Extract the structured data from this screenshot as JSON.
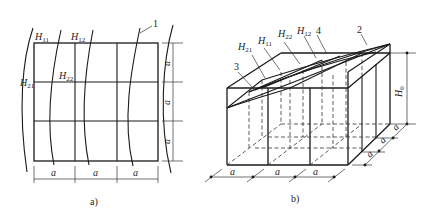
{
  "figure": {
    "panel_a": {
      "caption": "a)",
      "grid": {
        "rows": 3,
        "cols": 3
      },
      "labels": {
        "H11": {
          "base": "H",
          "sub": "11"
        },
        "H12": {
          "base": "H",
          "sub": "12"
        },
        "H21": {
          "base": "H",
          "sub": "21"
        },
        "H22": {
          "base": "H",
          "sub": "22"
        }
      },
      "callout": "1",
      "dim_horizontal": [
        "a",
        "a",
        "a"
      ],
      "dim_vertical": [
        "a",
        "a",
        "a"
      ]
    },
    "panel_b": {
      "caption": "b)",
      "labels": {
        "H21": {
          "base": "H",
          "sub": "21"
        },
        "H11": {
          "base": "H",
          "sub": "11"
        },
        "H22": {
          "base": "H",
          "sub": "22"
        },
        "H12": {
          "base": "H",
          "sub": "12"
        },
        "H0": {
          "base": "H",
          "sub": "0"
        }
      },
      "callouts": [
        "3",
        "4",
        "2"
      ],
      "dim_front": [
        "a",
        "a",
        "a"
      ],
      "dim_depth": [
        "a",
        "a",
        "a"
      ]
    }
  }
}
